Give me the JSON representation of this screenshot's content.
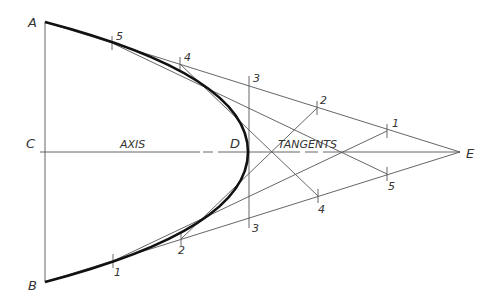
{
  "diagram": {
    "points": {
      "A": {
        "label": "A",
        "x": 45,
        "y": 22
      },
      "B": {
        "label": "B",
        "x": 45,
        "y": 282
      },
      "C": {
        "label": "C",
        "x": 45,
        "y": 152
      },
      "D": {
        "label": "D",
        "x": 248,
        "y": 152
      },
      "E": {
        "label": "E",
        "x": 460,
        "y": 152
      }
    },
    "axis_label": "AXIS",
    "tangents_label": "TANGENTS",
    "upper_divisions": [
      {
        "label": "5",
        "x": 112,
        "y": 43
      },
      {
        "label": "4",
        "x": 180,
        "y": 64
      },
      {
        "label": "3",
        "x": 249,
        "y": 86
      },
      {
        "label": "2",
        "x": 317,
        "y": 108
      },
      {
        "label": "1",
        "x": 387,
        "y": 131
      }
    ],
    "lower_divisions": [
      {
        "label": "1",
        "x": 113,
        "y": 261
      },
      {
        "label": "2",
        "x": 181,
        "y": 239
      },
      {
        "label": "3",
        "x": 249,
        "y": 218
      },
      {
        "label": "4",
        "x": 318,
        "y": 196
      },
      {
        "label": "5",
        "x": 387,
        "y": 174
      }
    ],
    "colors": {
      "curve": "#111111",
      "lines": "#555555",
      "text": "#333333"
    }
  }
}
